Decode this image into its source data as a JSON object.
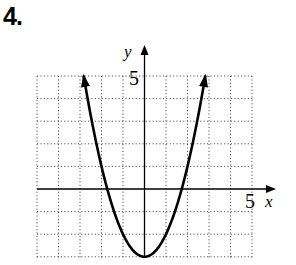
{
  "problem": {
    "number": "4."
  },
  "chart_data": {
    "type": "line",
    "title": "",
    "xlabel": "x",
    "ylabel": "y",
    "xlim": [
      -5,
      5
    ],
    "ylim": [
      -3,
      5
    ],
    "grid": true,
    "grid_style": "dotted",
    "tick_labels": {
      "x": [
        "5"
      ],
      "y": [
        "5"
      ]
    },
    "series": [
      {
        "name": "y = x^2 - 3",
        "equation": "y = x^2 - 3",
        "vertex": [
          0,
          -3
        ],
        "x_intercepts": [
          -1.73,
          1.73
        ],
        "x": [
          -2.83,
          -2.5,
          -2,
          -1.5,
          -1,
          -0.5,
          0,
          0.5,
          1,
          1.5,
          2,
          2.5,
          2.83
        ],
        "values": [
          5,
          3.25,
          1,
          -0.75,
          -2,
          -2.75,
          -3,
          -2.75,
          -2,
          -0.75,
          1,
          3.25,
          5
        ],
        "arrows_at_ends": true
      }
    ]
  },
  "labels": {
    "x_axis": "x",
    "y_axis": "y",
    "x_tick": "5",
    "y_tick": "5"
  },
  "colors": {
    "curve": "#000000",
    "grid": "#555555",
    "axis": "#000000"
  }
}
